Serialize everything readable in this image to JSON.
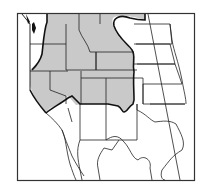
{
  "map": {
    "title": "Range map of western North America",
    "region": "Western United States and northern Mexico",
    "range_fill": "#c9c9c9",
    "background": "#ffffff",
    "line_color": "#1a1a1a",
    "shaded_states": [
      "Washington (east)",
      "Oregon (east)",
      "Idaho",
      "Montana (west)",
      "Wyoming",
      "Nevada",
      "Utah",
      "Colorado",
      "California (east/south)"
    ],
    "legend": []
  }
}
